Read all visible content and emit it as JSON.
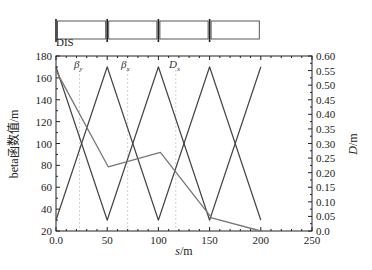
{
  "chart_data": {
    "type": "line",
    "title": "",
    "xlabel": "s/m",
    "ylabel": "beta函数值/m",
    "y2label": "D/m",
    "xlim": [
      0,
      250
    ],
    "ylim": [
      20,
      180
    ],
    "y2lim": [
      0.0,
      0.6
    ],
    "grid": false,
    "legend": "inline labels near top",
    "x_ticks": [
      "0.0",
      "50",
      "100",
      "150",
      "200",
      "250"
    ],
    "y_ticks": [
      "20",
      "40",
      "60",
      "80",
      "100",
      "120",
      "140",
      "160",
      "180"
    ],
    "y2_ticks": [
      "0.0",
      "0.05",
      "0.10",
      "0.15",
      "0.20",
      "0.25",
      "0.30",
      "0.35",
      "0.40",
      "0.45",
      "0.50",
      "0.55",
      "0.60"
    ],
    "series": [
      {
        "name": "βy",
        "axis": "left",
        "x": [
          0,
          50,
          100,
          150,
          200
        ],
        "values": [
          170,
          30,
          170,
          30,
          170
        ]
      },
      {
        "name": "βx",
        "axis": "left",
        "x": [
          0,
          50,
          100,
          150,
          200
        ],
        "values": [
          30,
          170,
          30,
          170,
          30
        ]
      },
      {
        "name": "Dx",
        "axis": "right",
        "x": [
          0,
          51,
          102,
          152,
          200
        ],
        "values": [
          0.55,
          0.22,
          0.27,
          0.045,
          0.0
        ]
      }
    ],
    "annotations": [
      {
        "text": "βy",
        "x": 23
      },
      {
        "text": "βx",
        "x": 70
      },
      {
        "text": "Dx",
        "x": 117
      }
    ],
    "lattice": {
      "label": "DIS",
      "cells": 4,
      "start": 0,
      "end": 200
    }
  },
  "labels": {
    "xlabel_s": "s",
    "xlabel_unit": "/m",
    "ylabel": "beta函数值/m",
    "y2label_d": "D",
    "y2label_unit": "/m",
    "lattice_label": "DIS",
    "beta_y": "β",
    "beta_y_sub": "y",
    "beta_x": "β",
    "beta_x_sub": "x",
    "d_x": "D",
    "d_x_sub": "x"
  }
}
